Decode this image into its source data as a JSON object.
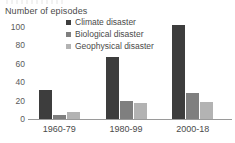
{
  "chart_data": {
    "type": "bar",
    "title": "",
    "subtitle": "",
    "ylabel": "Number of episodes",
    "xlabel": "",
    "categories": [
      "1960-79",
      "1980-99",
      "2000-18"
    ],
    "series": [
      {
        "name": "Climate disaster",
        "values": [
          32,
          67,
          102
        ],
        "color": "#3d3d3d"
      },
      {
        "name": "Biological disaster",
        "values": [
          4,
          20,
          28
        ],
        "color": "#7f7f7f"
      },
      {
        "name": "Geophysical disaster",
        "values": [
          8,
          17,
          18
        ],
        "color": "#b3b3b3"
      }
    ],
    "ylim": [
      0,
      100
    ],
    "yticks": [
      0,
      20,
      40,
      60,
      80,
      100
    ],
    "ytick_labels": [
      "0",
      "20",
      "40",
      "60",
      "80",
      "100"
    ],
    "grid": false,
    "legend_position": "top-center",
    "annotations": []
  }
}
